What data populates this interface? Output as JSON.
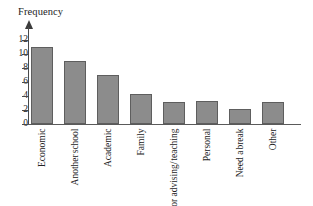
{
  "chart_data": {
    "type": "bar",
    "title": "",
    "xlabel": "",
    "ylabel": "Frequency",
    "ylim": [
      0,
      13
    ],
    "yticks": [
      0,
      2,
      4,
      6,
      8,
      10,
      12
    ],
    "grid": false,
    "legend": "none",
    "categories": [
      "Economic",
      "Another school",
      "Academic",
      "Family",
      "Poor advising/ teaching",
      "Personal",
      "Need a break",
      "Other"
    ],
    "category_lines": [
      [
        "Economic"
      ],
      [
        "Another",
        "school"
      ],
      [
        "Academic"
      ],
      [
        "Family"
      ],
      [
        "Poor advising/",
        "teaching"
      ],
      [
        "Personal"
      ],
      [
        "Need a",
        "break"
      ],
      [
        "Other"
      ]
    ],
    "values": [
      11,
      9,
      7,
      4.3,
      3.2,
      3.3,
      2.2,
      3.2
    ],
    "bar_color": "#8c8c8c",
    "bar_border_color": "#5e5e5e",
    "axis_color": "#4a4a4a"
  },
  "axis": {
    "y_title": "Frequency",
    "tick_labels": [
      "12",
      "10",
      "8",
      "6",
      "4",
      "2",
      "0"
    ]
  }
}
